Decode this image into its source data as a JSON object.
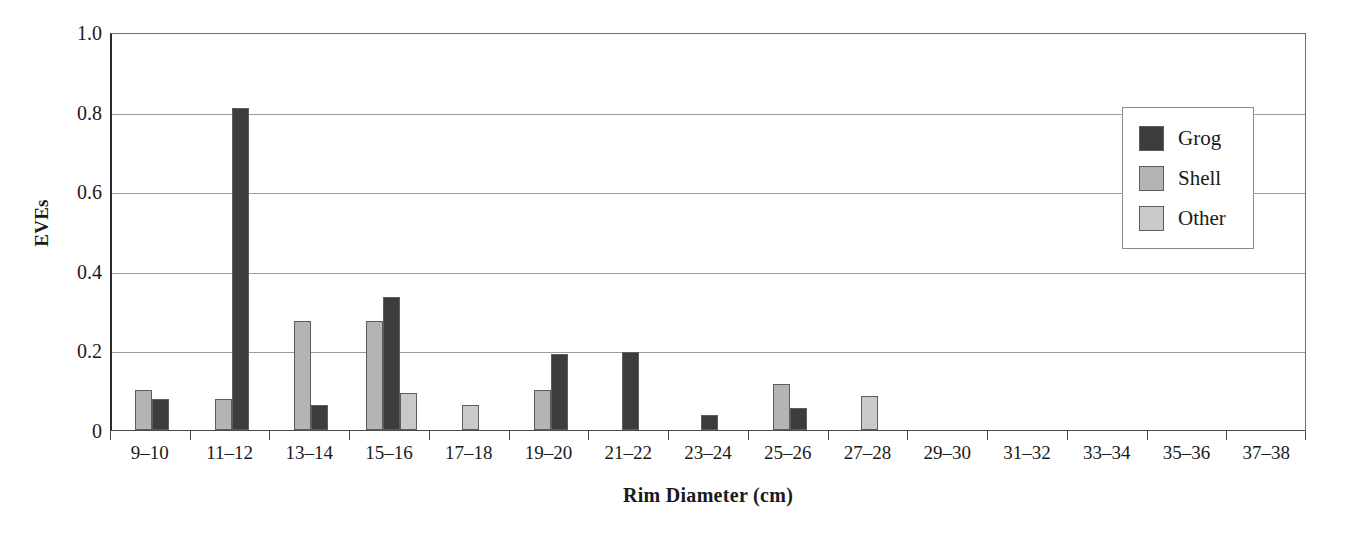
{
  "chart_data": {
    "type": "bar",
    "title": "",
    "xlabel": "Rim Diameter (cm)",
    "ylabel": "EVEs",
    "ylim": [
      0,
      1.0
    ],
    "yticks": [
      "0",
      "0.2",
      "0.4",
      "0.6",
      "0.8",
      "1.0"
    ],
    "ytick_values": [
      0,
      0.2,
      0.4,
      0.6,
      0.8,
      1.0
    ],
    "grid": "horizontal",
    "legend_position": "upper-right",
    "series_order_in_group": [
      "Shell",
      "Grog",
      "Other"
    ],
    "categories": [
      "9–10",
      "11–12",
      "13–14",
      "15–16",
      "17–18",
      "19–20",
      "21–22",
      "23–24",
      "25–26",
      "27–28",
      "29–30",
      "31–32",
      "33–34",
      "35–36",
      "37–38"
    ],
    "series": [
      {
        "name": "Grog",
        "color": "#3c3c3c",
        "values": [
          0.078,
          0.81,
          0.063,
          0.335,
          0,
          0.19,
          0.195,
          0.038,
          0.055,
          0,
          0,
          0,
          0,
          0,
          0
        ]
      },
      {
        "name": "Shell",
        "color": "#b4b4b4",
        "values": [
          0.1,
          0.079,
          0.275,
          0.275,
          0,
          0.1,
          0,
          0,
          0.115,
          0,
          0,
          0,
          0,
          0,
          0
        ]
      },
      {
        "name": "Other",
        "color": "#c9c9c9",
        "values": [
          0,
          0,
          0,
          0.094,
          0.062,
          0,
          0,
          0,
          0,
          0.086,
          0,
          0,
          0,
          0,
          0
        ]
      }
    ]
  },
  "legend": {
    "entries": [
      {
        "label": "Grog",
        "color": "#3c3c3c"
      },
      {
        "label": "Shell",
        "color": "#b4b4b4"
      },
      {
        "label": "Other",
        "color": "#c9c9c9"
      }
    ]
  },
  "axes": {
    "y_title": "EVEs",
    "x_title": "Rim Diameter (cm)"
  }
}
